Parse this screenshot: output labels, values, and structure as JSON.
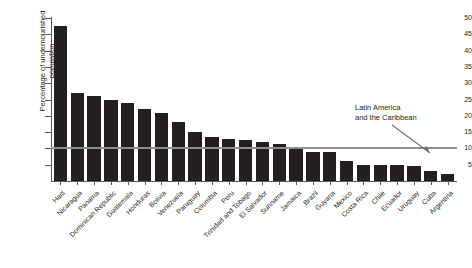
{
  "chart_data": {
    "type": "bar",
    "title": "",
    "xlabel": "",
    "ylabel": "Percentage of undernourished population",
    "ylim": [
      0,
      50
    ],
    "yticks": [
      0,
      5,
      10,
      15,
      20,
      25,
      30,
      35,
      40,
      45,
      50
    ],
    "ytick_labels": [
      "",
      "5",
      "10",
      "15",
      "20",
      "25",
      "30",
      "35",
      "40",
      "45",
      "50"
    ],
    "grid": false,
    "legend": "none",
    "bar_color": "#231f20",
    "reference_line": {
      "value": 10,
      "label": "Latin America and the Caribbean",
      "color": "#8d8d8f"
    },
    "categories": [
      "Haiti",
      "Nicaragua",
      "Panama",
      "Dominican Republic",
      "Guatemala",
      "Honduras",
      "Bolivia",
      "Venezuela",
      "Paraguay",
      "Colombia",
      "Peru",
      "Trinidad and Tobago",
      "El Salvador",
      "Suriname",
      "Jamaica",
      "Brazil",
      "Guyana",
      "Mexico",
      "Costa Rica",
      "Chile",
      "Ecuador",
      "Uruguay",
      "Cuba",
      "Argentina"
    ],
    "values": [
      47.5,
      27,
      26,
      25,
      24,
      22,
      21,
      18,
      15,
      13.5,
      13,
      12.5,
      12,
      11.5,
      10,
      9,
      9,
      6,
      5,
      5,
      5,
      4.5,
      3,
      2
    ]
  },
  "annotation": {
    "line1": "Latin America",
    "line2": "and the Caribbean"
  }
}
